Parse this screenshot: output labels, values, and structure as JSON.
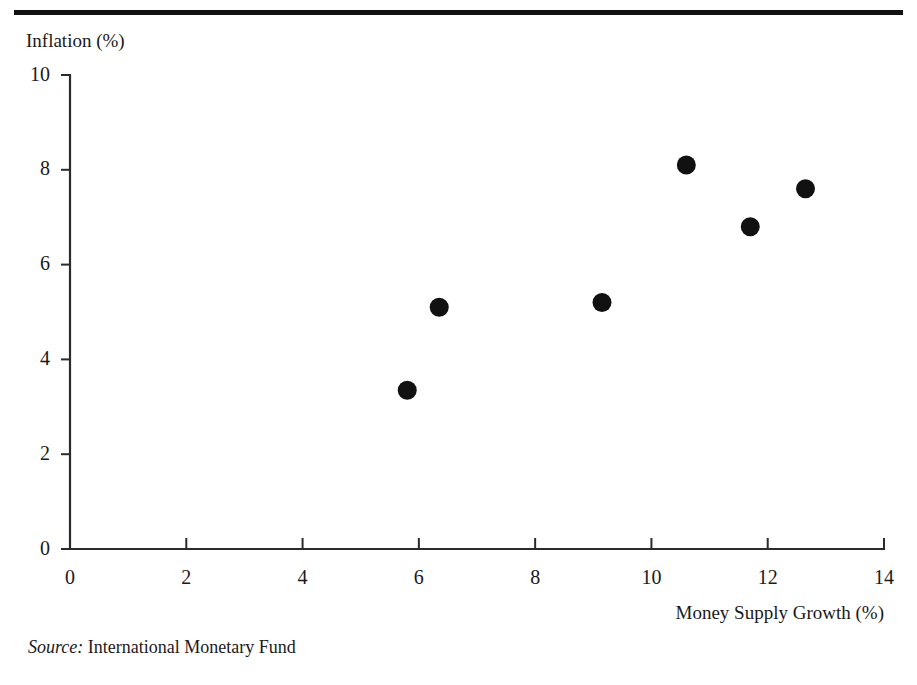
{
  "figure": {
    "title": "",
    "title_visible_note": "title is cropped off above the top edge of the screenshot",
    "source_lead": "Source:",
    "source_text": " International Monetary Fund"
  },
  "chart_data": {
    "type": "scatter",
    "title": "",
    "xlabel": "Money Supply Growth (%)",
    "ylabel": "Inflation (%)",
    "xlim": [
      0,
      14
    ],
    "ylim": [
      0,
      10
    ],
    "xticks": [
      "0",
      "2",
      "4",
      "6",
      "8",
      "10",
      "12",
      "14"
    ],
    "xtick_values": [
      0,
      2,
      4,
      6,
      8,
      10,
      12,
      14
    ],
    "yticks": [
      "0",
      "2",
      "4",
      "6",
      "8",
      "10"
    ],
    "ytick_values": [
      0,
      2,
      4,
      6,
      8,
      10
    ],
    "grid": false,
    "legend": "none",
    "marker": "filled-circle",
    "marker_color": "#111111",
    "points": [
      {
        "x": 5.8,
        "y": 3.35
      },
      {
        "x": 6.35,
        "y": 5.1
      },
      {
        "x": 9.15,
        "y": 5.2
      },
      {
        "x": 10.6,
        "y": 8.1
      },
      {
        "x": 11.7,
        "y": 6.8
      },
      {
        "x": 12.65,
        "y": 7.6
      }
    ]
  }
}
